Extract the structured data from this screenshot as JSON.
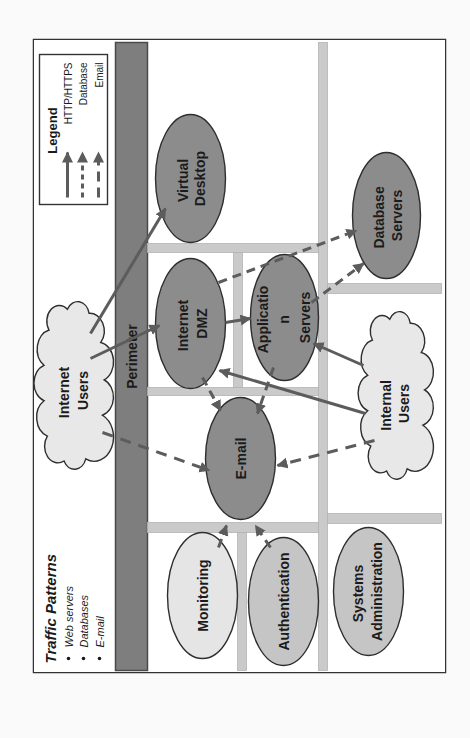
{
  "diagram": {
    "title": "Traffic Patterns",
    "traffic_patterns": [
      "Web servers",
      "Databases",
      "E-mail"
    ],
    "perimeter_label": "Perimeter"
  },
  "legend": {
    "title": "Legend",
    "entries": [
      {
        "label": "HTTP/HTTPS",
        "line_style": "solid"
      },
      {
        "label": "Database",
        "line_style": "dashed"
      },
      {
        "label": "Email",
        "line_style": "long-dashed"
      }
    ]
  },
  "nodes": {
    "internet_users": {
      "lines": [
        "Internet",
        "Users"
      ],
      "shape": "cloud"
    },
    "internal_users": {
      "lines": [
        "Internal",
        "Users"
      ],
      "shape": "cloud"
    },
    "virtual_desktop": {
      "lines": [
        "Virtual",
        "Desktop"
      ],
      "shape": "ellipse"
    },
    "internet_dmz": {
      "lines": [
        "Internet",
        "DMZ"
      ],
      "shape": "ellipse"
    },
    "application_servers": {
      "lines": [
        "Applicatio",
        "n",
        "Servers"
      ],
      "shape": "ellipse"
    },
    "database_servers": {
      "lines": [
        "Database",
        "Servers"
      ],
      "shape": "ellipse"
    },
    "email": {
      "lines": [
        "E-mail"
      ],
      "shape": "ellipse"
    },
    "monitoring": {
      "lines": [
        "Monitoring"
      ],
      "shape": "ellipse"
    },
    "authentication": {
      "lines": [
        "Authentication"
      ],
      "shape": "ellipse"
    },
    "systems_administration": {
      "lines": [
        "Systems",
        "Administration"
      ],
      "shape": "ellipse"
    }
  },
  "connections": [
    {
      "from": "Internet Users",
      "to": "Virtual Desktop",
      "type": "HTTP/HTTPS"
    },
    {
      "from": "Internet Users",
      "to": "Internet DMZ",
      "type": "HTTP/HTTPS"
    },
    {
      "from": "Internet DMZ",
      "to": "Application Servers",
      "type": "HTTP/HTTPS"
    },
    {
      "from": "Internal Users",
      "to": "Application Servers",
      "type": "HTTP/HTTPS"
    },
    {
      "from": "Internal Users",
      "to": "Internet DMZ",
      "type": "HTTP/HTTPS"
    },
    {
      "from": "Internet DMZ",
      "to": "Database Servers",
      "type": "Database"
    },
    {
      "from": "Application Servers",
      "to": "Database Servers",
      "type": "Database"
    },
    {
      "from": "Internet Users",
      "to": "E-mail",
      "type": "Email"
    },
    {
      "from": "Internal Users",
      "to": "E-mail",
      "type": "Email"
    },
    {
      "from": "Internet DMZ",
      "to": "E-mail",
      "type": "Email"
    },
    {
      "from": "Application Servers",
      "to": "E-mail",
      "type": "Email"
    },
    {
      "from": "Monitoring",
      "to": "E-mail",
      "type": "Email"
    },
    {
      "from": "Authentication",
      "to": "E-mail",
      "type": "Email"
    }
  ],
  "colors": {
    "core_node": "#8c8c8c",
    "monitoring_node": "#e5e5e5",
    "support_node": "#c5c5c5",
    "cloud": "#e8e8e8",
    "perimeter": "#7e7e7e",
    "zone_bar": "#cacaca",
    "connector": "#5c5c5c"
  }
}
